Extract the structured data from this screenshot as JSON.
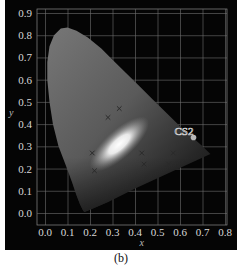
{
  "caption": "(b)",
  "chart_data": {
    "type": "scatter",
    "title": "",
    "subtitle": "",
    "xlabel": "x",
    "ylabel": "y",
    "xlim": [
      0.0,
      0.8
    ],
    "ylim": [
      0.0,
      0.9
    ],
    "x_ticks": [
      "0.0",
      "0.1",
      "0.2",
      "0.3",
      "0.4",
      "0.5",
      "0.6",
      "0.7",
      "0.8"
    ],
    "y_ticks": [
      "0.0",
      "0.1",
      "0.2",
      "0.3",
      "0.4",
      "0.5",
      "0.6",
      "0.7",
      "0.8",
      "0.9"
    ],
    "grid": true,
    "background": "CIE 1931 chromaticity diagram (grayscale horseshoe gamut)",
    "series": [
      {
        "name": "x-markers",
        "marker": "x",
        "points": [
          {
            "x": 0.33,
            "y": 0.47
          },
          {
            "x": 0.28,
            "y": 0.43
          },
          {
            "x": 0.21,
            "y": 0.27
          },
          {
            "x": 0.22,
            "y": 0.19
          },
          {
            "x": 0.43,
            "y": 0.27
          },
          {
            "x": 0.44,
            "y": 0.22
          },
          {
            "x": 0.57,
            "y": 0.27
          },
          {
            "x": 0.55,
            "y": 0.22
          }
        ]
      },
      {
        "name": "CS2",
        "marker": "circle",
        "points": [
          {
            "x": 0.66,
            "y": 0.34
          }
        ]
      }
    ],
    "annotations": [
      {
        "text": "CS2",
        "x": 0.62,
        "y": 0.37
      }
    ],
    "legend": null
  }
}
